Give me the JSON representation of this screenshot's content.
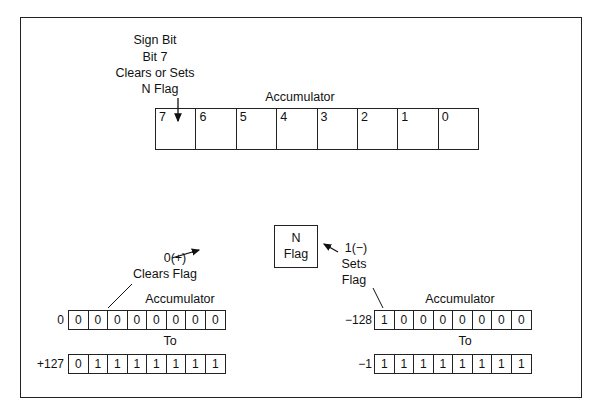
{
  "top": {
    "annotation_lines": [
      "Sign Bit",
      "Bit 7",
      "Clears or Sets",
      "N Flag"
    ],
    "register_title": "Accumulator",
    "bits": [
      "7",
      "6",
      "5",
      "4",
      "3",
      "2",
      "1",
      "0"
    ]
  },
  "nflag": {
    "line1": "N",
    "line2": "Flag"
  },
  "positive": {
    "note_line1": "0(+)",
    "note_line2": "Clears Flag",
    "title": "Accumulator",
    "to_label": "To",
    "from": {
      "label": "0",
      "bits": [
        "0",
        "0",
        "0",
        "0",
        "0",
        "0",
        "0",
        "0"
      ]
    },
    "to": {
      "label": "+127",
      "bits": [
        "0",
        "1",
        "1",
        "1",
        "1",
        "1",
        "1",
        "1"
      ]
    }
  },
  "negative": {
    "note_line1": "1(−)",
    "note_line2": "Sets",
    "note_line3": "Flag",
    "title": "Accumulator",
    "to_label": "To",
    "from": {
      "label": "−128",
      "bits": [
        "1",
        "0",
        "0",
        "0",
        "0",
        "0",
        "0",
        "0"
      ]
    },
    "to": {
      "label": "−1",
      "bits": [
        "1",
        "1",
        "1",
        "1",
        "1",
        "1",
        "1",
        "1"
      ]
    }
  }
}
